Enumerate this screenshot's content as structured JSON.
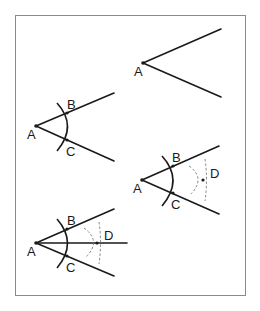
{
  "diagram": {
    "title": "",
    "colors": {
      "line": "#1a1a1a",
      "construction": "#777777",
      "frame": "#8a8a8a",
      "background": "#ffffff"
    },
    "steps": [
      {
        "id": 1,
        "labels": {
          "A": "A"
        }
      },
      {
        "id": 2,
        "labels": {
          "A": "A",
          "B": "B",
          "C": "C"
        }
      },
      {
        "id": 3,
        "labels": {
          "A": "A",
          "B": "B",
          "C": "C",
          "D": "D"
        }
      },
      {
        "id": 4,
        "labels": {
          "A": "A",
          "B": "B",
          "C": "C",
          "D": "D"
        }
      }
    ]
  }
}
